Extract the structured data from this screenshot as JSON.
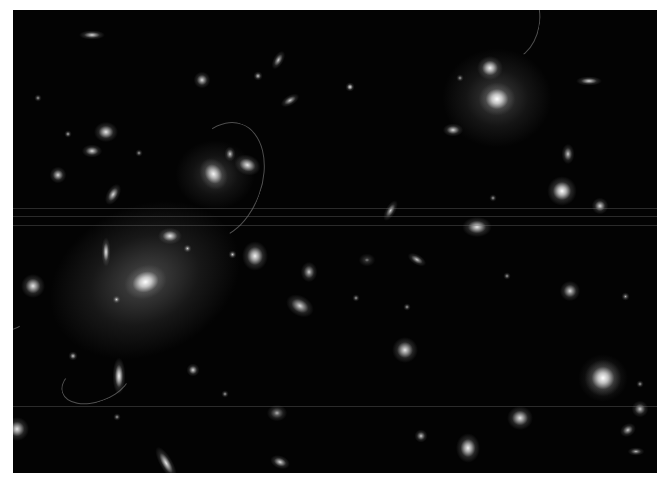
{
  "image": {
    "description": "Deep-field grayscale telescope image of a galaxy cluster with bright elliptical galaxies, diffuse halos, and faint lensed arcs",
    "background_color": "#030303",
    "frame_color": "#ffffff"
  },
  "halos": [
    {
      "x": 145,
      "y": 280,
      "w": 200,
      "h": 150,
      "rot": -25,
      "a": 0.35
    },
    {
      "x": 497,
      "y": 98,
      "w": 110,
      "h": 100,
      "rot": 0,
      "a": 0.3
    },
    {
      "x": 215,
      "y": 175,
      "w": 80,
      "h": 70,
      "rot": 0,
      "a": 0.25
    },
    {
      "x": 603,
      "y": 378,
      "w": 50,
      "h": 48,
      "rot": 0,
      "a": 0.3
    }
  ],
  "galaxies": [
    {
      "x": 145,
      "y": 282,
      "w": 26,
      "h": 20,
      "rot": -20,
      "b": 1
    },
    {
      "x": 497,
      "y": 99,
      "w": 22,
      "h": 20,
      "rot": 0,
      "b": 1
    },
    {
      "x": 490,
      "y": 68,
      "w": 16,
      "h": 14,
      "rot": 0,
      "b": 0.95
    },
    {
      "x": 213,
      "y": 174,
      "w": 16,
      "h": 20,
      "rot": -30,
      "b": 0.95
    },
    {
      "x": 247,
      "y": 165,
      "w": 16,
      "h": 12,
      "rot": 20,
      "b": 0.9
    },
    {
      "x": 230,
      "y": 154,
      "w": 7,
      "h": 9,
      "rot": 0,
      "b": 0.8
    },
    {
      "x": 562,
      "y": 191,
      "w": 18,
      "h": 18,
      "rot": 0,
      "b": 1
    },
    {
      "x": 603,
      "y": 378,
      "w": 22,
      "h": 22,
      "rot": 0,
      "b": 1
    },
    {
      "x": 255,
      "y": 256,
      "w": 16,
      "h": 18,
      "rot": 0,
      "b": 0.95
    },
    {
      "x": 106,
      "y": 132,
      "w": 14,
      "h": 12,
      "rot": 0,
      "b": 0.9
    },
    {
      "x": 33,
      "y": 286,
      "w": 14,
      "h": 14,
      "rot": 0,
      "b": 0.9
    },
    {
      "x": 17,
      "y": 429,
      "w": 14,
      "h": 14,
      "rot": 0,
      "b": 0.9
    },
    {
      "x": 106,
      "y": 252,
      "w": 6,
      "h": 18,
      "rot": 0,
      "b": 0.9
    },
    {
      "x": 119,
      "y": 376,
      "w": 8,
      "h": 22,
      "rot": 0,
      "b": 0.95
    },
    {
      "x": 113,
      "y": 195,
      "w": 8,
      "h": 14,
      "rot": 30,
      "b": 0.85
    },
    {
      "x": 170,
      "y": 236,
      "w": 14,
      "h": 10,
      "rot": 0,
      "b": 0.9
    },
    {
      "x": 92,
      "y": 35,
      "w": 16,
      "h": 6,
      "rot": 0,
      "b": 0.85
    },
    {
      "x": 278,
      "y": 60,
      "w": 6,
      "h": 12,
      "rot": 30,
      "b": 0.8
    },
    {
      "x": 290,
      "y": 100,
      "w": 12,
      "h": 6,
      "rot": -30,
      "b": 0.8
    },
    {
      "x": 202,
      "y": 80,
      "w": 10,
      "h": 10,
      "rot": 0,
      "b": 0.85
    },
    {
      "x": 258,
      "y": 76,
      "w": 6,
      "h": 6,
      "rot": 0,
      "b": 0.8
    },
    {
      "x": 92,
      "y": 151,
      "w": 12,
      "h": 8,
      "rot": 0,
      "b": 0.85
    },
    {
      "x": 58,
      "y": 175,
      "w": 10,
      "h": 10,
      "rot": 0,
      "b": 0.85
    },
    {
      "x": 300,
      "y": 306,
      "w": 18,
      "h": 12,
      "rot": 30,
      "b": 0.85
    },
    {
      "x": 309,
      "y": 272,
      "w": 10,
      "h": 12,
      "rot": 0,
      "b": 0.8
    },
    {
      "x": 350,
      "y": 87,
      "w": 6,
      "h": 6,
      "rot": 0,
      "b": 0.9
    },
    {
      "x": 453,
      "y": 130,
      "w": 12,
      "h": 8,
      "rot": 0,
      "b": 0.85
    },
    {
      "x": 589,
      "y": 81,
      "w": 16,
      "h": 6,
      "rot": 0,
      "b": 0.85
    },
    {
      "x": 390,
      "y": 211,
      "w": 6,
      "h": 14,
      "rot": 30,
      "b": 0.8
    },
    {
      "x": 477,
      "y": 227,
      "w": 18,
      "h": 12,
      "rot": 0,
      "b": 0.9
    },
    {
      "x": 568,
      "y": 154,
      "w": 8,
      "h": 12,
      "rot": 0,
      "b": 0.8
    },
    {
      "x": 600,
      "y": 206,
      "w": 10,
      "h": 10,
      "rot": 0,
      "b": 0.85
    },
    {
      "x": 405,
      "y": 350,
      "w": 16,
      "h": 16,
      "rot": 0,
      "b": 0.9
    },
    {
      "x": 570,
      "y": 291,
      "w": 12,
      "h": 12,
      "rot": 0,
      "b": 0.85
    },
    {
      "x": 520,
      "y": 418,
      "w": 16,
      "h": 14,
      "rot": 0,
      "b": 0.9
    },
    {
      "x": 468,
      "y": 448,
      "w": 14,
      "h": 18,
      "rot": 0,
      "b": 0.95
    },
    {
      "x": 417,
      "y": 259,
      "w": 12,
      "h": 6,
      "rot": 30,
      "b": 0.8
    },
    {
      "x": 166,
      "y": 463,
      "w": 8,
      "h": 22,
      "rot": -30,
      "b": 0.9
    },
    {
      "x": 193,
      "y": 370,
      "w": 8,
      "h": 8,
      "rot": 0,
      "b": 0.85
    },
    {
      "x": 73,
      "y": 356,
      "w": 6,
      "h": 6,
      "rot": 0,
      "b": 0.8
    },
    {
      "x": 277,
      "y": 413,
      "w": 12,
      "h": 10,
      "rot": 0,
      "b": 0.7
    },
    {
      "x": 280,
      "y": 462,
      "w": 12,
      "h": 8,
      "rot": 20,
      "b": 0.85
    },
    {
      "x": 640,
      "y": 409,
      "w": 10,
      "h": 10,
      "rot": 0,
      "b": 0.8
    },
    {
      "x": 628,
      "y": 430,
      "w": 10,
      "h": 8,
      "rot": -30,
      "b": 0.8
    },
    {
      "x": 636,
      "y": 451,
      "w": 10,
      "h": 5,
      "rot": 0,
      "b": 0.75
    },
    {
      "x": 421,
      "y": 436,
      "w": 8,
      "h": 8,
      "rot": 0,
      "b": 0.8
    },
    {
      "x": 117,
      "y": 417,
      "w": 4,
      "h": 4,
      "rot": 0,
      "b": 0.7
    },
    {
      "x": 225,
      "y": 394,
      "w": 4,
      "h": 4,
      "rot": 0,
      "b": 0.7
    },
    {
      "x": 187,
      "y": 248,
      "w": 5,
      "h": 5,
      "rot": 0,
      "b": 0.8
    },
    {
      "x": 232,
      "y": 254,
      "w": 5,
      "h": 5,
      "rot": 0,
      "b": 0.8
    },
    {
      "x": 116,
      "y": 299,
      "w": 5,
      "h": 5,
      "rot": 0,
      "b": 0.8
    },
    {
      "x": 68,
      "y": 134,
      "w": 4,
      "h": 4,
      "rot": 0,
      "b": 0.75
    },
    {
      "x": 139,
      "y": 153,
      "w": 4,
      "h": 4,
      "rot": 0,
      "b": 0.7
    },
    {
      "x": 38,
      "y": 98,
      "w": 4,
      "h": 4,
      "rot": 0,
      "b": 0.7
    },
    {
      "x": 460,
      "y": 78,
      "w": 4,
      "h": 4,
      "rot": 0,
      "b": 0.7
    },
    {
      "x": 507,
      "y": 276,
      "w": 4,
      "h": 4,
      "rot": 0,
      "b": 0.7
    },
    {
      "x": 493,
      "y": 198,
      "w": 4,
      "h": 4,
      "rot": 0,
      "b": 0.7
    },
    {
      "x": 407,
      "y": 307,
      "w": 4,
      "h": 4,
      "rot": 0,
      "b": 0.7
    },
    {
      "x": 640,
      "y": 384,
      "w": 4,
      "h": 4,
      "rot": 0,
      "b": 0.7
    },
    {
      "x": 625,
      "y": 296,
      "w": 5,
      "h": 5,
      "rot": 0,
      "b": 0.7
    },
    {
      "x": 367,
      "y": 260,
      "w": 10,
      "h": 8,
      "rot": 0,
      "b": 0.5
    },
    {
      "x": 356,
      "y": 298,
      "w": 4,
      "h": 4,
      "rot": 0,
      "b": 0.7
    }
  ],
  "arcs": [
    {
      "x": 220,
      "y": 180,
      "w": 80,
      "h": 120,
      "rot": 20
    },
    {
      "x": 508,
      "y": 20,
      "w": 60,
      "h": 80,
      "rot": 10
    },
    {
      "x": 10,
      "y": 290,
      "w": 60,
      "h": 80,
      "rot": 200
    },
    {
      "x": 95,
      "y": 380,
      "w": 70,
      "h": 40,
      "rot": 160
    }
  ],
  "scanlines": [
    208,
    216,
    225,
    406
  ]
}
